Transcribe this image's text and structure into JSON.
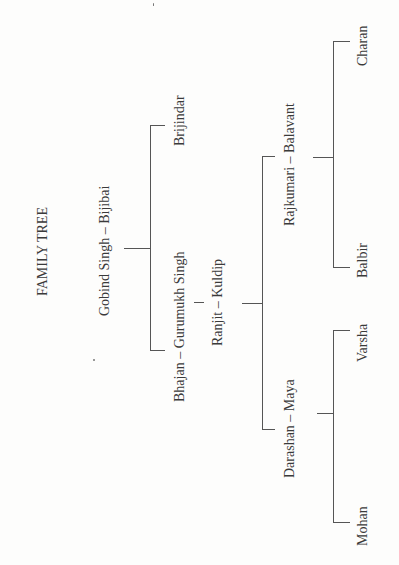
{
  "diagram": {
    "title": "FAMILY TREE",
    "orientation": "rotated 90° counter-clockwise",
    "nodes": {
      "gen1": "Gobind Singh – Bijibai",
      "gen2a": "Brijindar",
      "gen2b": "Bhajan – Gurumukh Singh",
      "gen3": "Ranjit – Kuldip",
      "gen4a": "Rajkumari – Balavant",
      "gen4b": "Darashan – Maya",
      "gen5a": "Charan",
      "gen5b": "Balbir",
      "gen5c": "Varsha",
      "gen5d": "Mohan"
    },
    "edges": [
      {
        "from": "Gobind Singh – Bijibai",
        "to": "Brijindar",
        "type": "child"
      },
      {
        "from": "Gobind Singh – Bijibai",
        "to": "Bhajan – Gurumukh Singh",
        "type": "child"
      },
      {
        "from": "Bhajan – Gurumukh Singh",
        "to": "Ranjit – Kuldip",
        "type": "child"
      },
      {
        "from": "Ranjit – Kuldip",
        "to": "Rajkumari – Balavant",
        "type": "child"
      },
      {
        "from": "Ranjit – Kuldip",
        "to": "Darashan – Maya",
        "type": "child"
      },
      {
        "from": "Rajkumari – Balavant",
        "to": "Charan",
        "type": "child"
      },
      {
        "from": "Rajkumari – Balavant",
        "to": "Balbir",
        "type": "child"
      },
      {
        "from": "Darashan – Maya",
        "to": "Varsha",
        "type": "child"
      },
      {
        "from": "Darashan – Maya",
        "to": "Mohan",
        "type": "child"
      }
    ]
  }
}
